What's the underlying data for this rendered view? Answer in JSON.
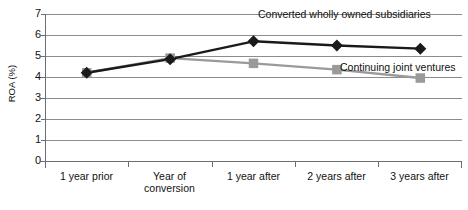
{
  "chart_data": {
    "type": "line",
    "title": "",
    "xlabel": "",
    "ylabel": "ROA (%)",
    "ylim": [
      0,
      7
    ],
    "ytick_labels": [
      "0",
      "1",
      "2",
      "3",
      "4",
      "5",
      "6",
      "7"
    ],
    "grid": true,
    "legend_position": "inline-annotation",
    "categories": [
      "1 year prior",
      "Year of conversion",
      "1 year after",
      "2 years after",
      "3 years after"
    ],
    "category_lines": [
      [
        "1 year prior"
      ],
      [
        "Year of",
        "conversion"
      ],
      [
        "1 year after"
      ],
      [
        "2 years after"
      ],
      [
        "3 years after"
      ]
    ],
    "series": [
      {
        "name": "Converted wholly owned subsidiaries",
        "marker": "diamond",
        "color": "#1a1a1a",
        "values": [
          4.2,
          4.85,
          5.7,
          5.5,
          5.35
        ]
      },
      {
        "name": "Continuing joint ventures",
        "marker": "square",
        "color": "#9a9a9a",
        "values": [
          4.2,
          4.9,
          4.65,
          4.35,
          3.95
        ]
      }
    ],
    "annotations": [
      {
        "text": "Converted wholly owned subsidiaries",
        "series": "Converted wholly owned subsidiaries"
      },
      {
        "text": "Continuing joint ventures",
        "series": "Continuing joint ventures"
      }
    ]
  },
  "colors": {
    "series_dark": "#1a1a1a",
    "series_gray": "#9a9a9a",
    "gridline": "#8c8c8c",
    "axis": "#6e6e6e",
    "background": "#ffffff",
    "text": "#111111"
  }
}
